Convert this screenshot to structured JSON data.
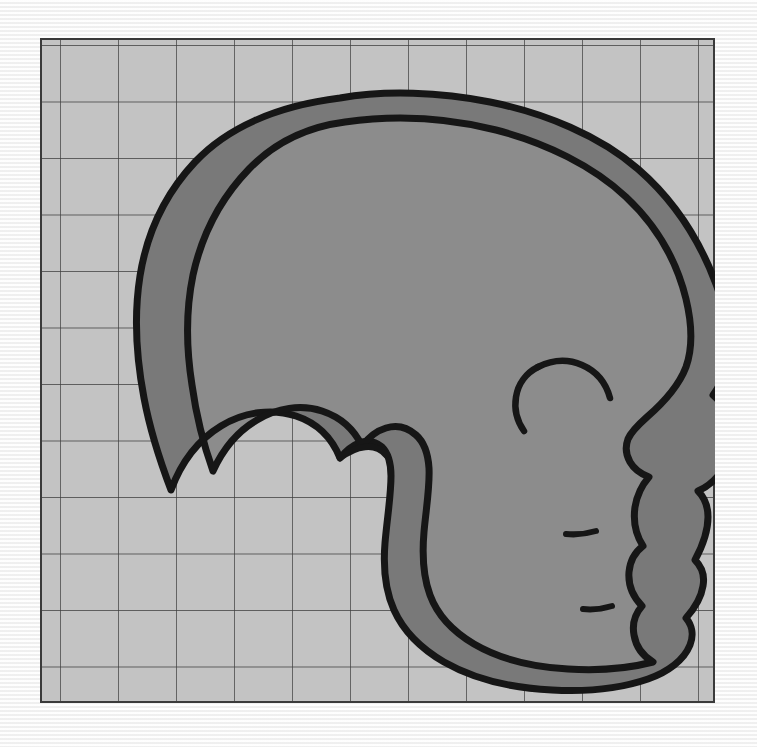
{
  "figure": {
    "kind": "anatomical-outline-diagram",
    "subject": "hominin cranium, lateral (left-facing-right) profile",
    "caption": "",
    "title": "",
    "colors": {
      "page_background": "#f6f6f6",
      "panel_fill": "#c3c3c3",
      "grid_line": "#3c3c3c",
      "panel_border": "#3a3a3a",
      "bone_band_fill": "#797979",
      "endocranial_fill": "#8c8c8c",
      "outline_stroke": "#161616"
    },
    "panel": {
      "x": 40,
      "y": 38,
      "width": 675,
      "height": 665,
      "border_width": 2
    },
    "grid": {
      "visible": true,
      "columns": 12,
      "rows": 12,
      "cell_width": 58,
      "cell_height": 56.5,
      "line_width": 1.4,
      "x_offset": 20,
      "y_offset": 7,
      "label": "measurement grid"
    },
    "layers": [
      {
        "name": "panel-background",
        "label": "Grid panel background",
        "fill": "#c3c3c3"
      },
      {
        "name": "ectocranial-outline",
        "label": "Outer bone surface (ectocranial)",
        "fill": "#797979"
      },
      {
        "name": "endocranial-outline",
        "label": "Inner bone surface (endocranial)",
        "fill": "#8c8c8c"
      },
      {
        "name": "facial-detail-lines",
        "label": "Facial and nasal detail strokes",
        "fill": "none"
      }
    ],
    "geometry": {
      "outer_outline": "M 300 60 C 345 52 400 54 450 64 C 505 75 560 98 598 131 C 636 164 660 203 676 246 C 688 279 690 305 686 325 C 684 338 679 349 673 357 C 679 362 686 372 689 385 C 693 402 690 419 682 432 C 676 442 667 449 658 453 C 664 459 668 468 668 479 C 668 494 662 509 655 522 C 661 528 665 537 663 548 C 661 561 654 571 646 580 C 652 587 654 597 650 607 C 644 622 628 634 608 641 C 582 650 548 654 512 652 C 470 650 432 640 404 624 C 380 610 363 592 354 572 C 345 552 343 530 345 505 C 347 481 351 458 351 438 C 351 424 348 415 342 409 C 335 403 327 402 319 405 C 311 408 305 414 300 420 C 292 400 277 385 256 378 C 232 370 204 374 181 388 C 158 402 141 425 131 452 C 120 423 110 392 104 360 C 96 318 94 276 100 238 C 107 194 126 155 155 124 C 186 91 235 68 300 60 Z",
      "inner_outline": "M 305 84 C 355 77 408 80 456 92 C 506 105 553 128 586 159 C 618 189 637 224 646 261 C 653 290 652 312 646 329 C 638 350 622 366 607 379 C 598 387 591 394 588 401 C 585 409 586 417 590 424 C 594 431 601 436 609 439 C 602 447 597 457 595 469 C 593 483 596 497 603 508 C 595 514 590 523 589 534 C 588 547 593 559 602 568 C 595 576 592 586 594 597 C 596 609 603 618 613 624 C 590 630 560 633 528 631 C 492 629 458 620 434 606 C 412 593 397 576 390 557 C 383 538 382 517 384 494 C 386 471 390 449 389 430 C 388 415 384 404 376 397 C 367 389 356 387 346 390 C 336 393 328 400 322 408 C 314 391 300 379 282 373 C 261 366 237 370 217 382 C 198 393 183 411 173 433 C 163 405 156 376 152 347 C 146 309 146 271 153 237 C 162 196 181 160 209 131 C 238 101 274 88 305 84 Z",
      "detail_lines": [
        "M 660 348 C 648 344 636 344 626 349 C 614 355 606 366 603 379",
        "M 603 379 C 600 391 602 404 608 414 C 612 420 617 425 623 429",
        "M 596 487 C 588 490 580 492 572 492",
        "M 600 560 C 592 563 584 565 576 565"
      ]
    }
  }
}
